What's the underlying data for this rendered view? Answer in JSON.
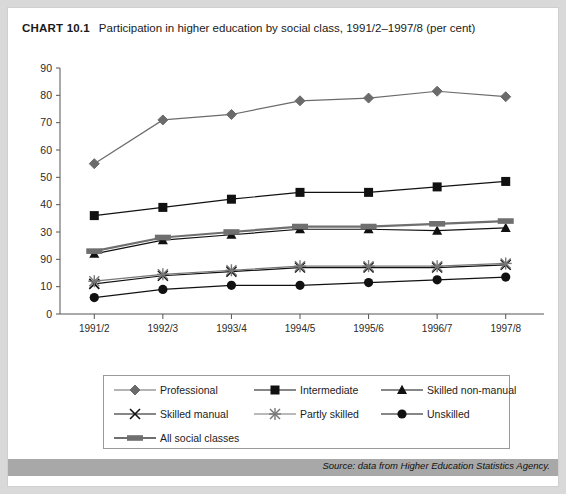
{
  "header": {
    "chart_tag": "CHART 10.1",
    "chart_title": "Participation in higher education by social class, 1991/2–1997/8 (per cent)"
  },
  "source": {
    "label": "Source: data from Higher Education Statistics Agency."
  },
  "legend": {
    "items": [
      {
        "label": "Professional",
        "marker": "diamond-marker",
        "color": "#6b6b6b"
      },
      {
        "label": "Intermediate",
        "marker": "square-marker",
        "color": "#111111"
      },
      {
        "label": "Skilled non-manual",
        "marker": "triangle-marker",
        "color": "#111111"
      },
      {
        "label": "Skilled manual",
        "marker": "cross-marker",
        "color": "#111111"
      },
      {
        "label": "Partly skilled",
        "marker": "star-marker",
        "color": "#777777"
      },
      {
        "label": "Unskilled",
        "marker": "circle-marker",
        "color": "#111111"
      },
      {
        "label": "All social classes",
        "marker": "bar-marker",
        "color": "#6f6f6f"
      }
    ]
  },
  "chart_data": {
    "type": "line",
    "title": "Participation in higher education by social class, 1991/2–1997/8 (per cent)",
    "xlabel": "",
    "ylabel": "",
    "ylim": [
      0,
      90
    ],
    "yticks": [
      0,
      10,
      20,
      30,
      40,
      50,
      60,
      70,
      80,
      90
    ],
    "ytick_labels": [
      "0",
      "10",
      "90",
      "30",
      "40",
      "50",
      "60",
      "70",
      "80",
      "90"
    ],
    "grid": false,
    "legend_position": "bottom",
    "categories": [
      "1991/2",
      "1992/3",
      "1993/4",
      "1994/5",
      "1995/6",
      "1996/7",
      "1997/8"
    ],
    "series": [
      {
        "name": "Professional",
        "values": [
          55,
          71,
          73,
          78,
          79,
          81.5,
          79.5
        ],
        "color": "#6b6b6b",
        "marker": "diamond"
      },
      {
        "name": "Intermediate",
        "values": [
          36,
          39,
          42,
          44.5,
          44.5,
          46.5,
          48.5
        ],
        "color": "#111111",
        "marker": "square"
      },
      {
        "name": "Skilled non-manual",
        "values": [
          22,
          27,
          29,
          31,
          31,
          30.5,
          31.5
        ],
        "color": "#111111",
        "marker": "triangle"
      },
      {
        "name": "All social classes",
        "values": [
          23,
          28,
          30,
          32,
          32,
          33,
          34
        ],
        "color": "#6f6f6f",
        "marker": "bar"
      },
      {
        "name": "Skilled manual",
        "values": [
          11,
          14,
          15.5,
          17,
          17,
          17,
          18
        ],
        "color": "#111111",
        "marker": "cross"
      },
      {
        "name": "Partly skilled",
        "values": [
          12,
          14.5,
          16,
          17.5,
          17.5,
          17.5,
          18.5
        ],
        "color": "#777777",
        "marker": "star"
      },
      {
        "name": "Unskilled",
        "values": [
          6,
          9,
          10.5,
          10.5,
          11.5,
          12.5,
          13.5
        ],
        "color": "#111111",
        "marker": "circle"
      }
    ]
  }
}
